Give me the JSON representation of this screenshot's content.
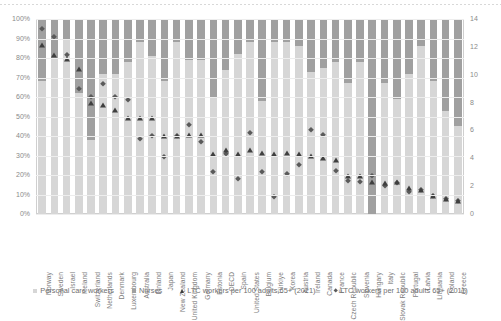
{
  "chart_data": {
    "type": "bar",
    "subtype": "stacked-bar-with-markers",
    "title": "",
    "xlabel": "",
    "ylabel": "",
    "ylim": [
      0,
      100
    ],
    "y2lim": [
      0,
      14
    ],
    "y_ticks": [
      "0%",
      "10%",
      "20%",
      "30%",
      "40%",
      "50%",
      "60%",
      "70%",
      "80%",
      "90%",
      "100%"
    ],
    "y2_ticks": [
      "0",
      "2",
      "4",
      "6",
      "8",
      "10",
      "12",
      "14"
    ],
    "grid": true,
    "legend_position": "bottom",
    "categories": [
      "Norway",
      "Sweden",
      "Israel",
      "Iceland",
      "Switzerland",
      "Netherlands",
      "Denmark",
      "Luxembourg",
      "Australia",
      "Finland",
      "Japan",
      "New Zealand",
      "United Kingdom",
      "Germany",
      "Estonia",
      "OECD",
      "Spain",
      "United States",
      "Belgium",
      "Türkiye",
      "Korea",
      "Austria",
      "Ireland",
      "Canada",
      "France",
      "Czech Republic",
      "Slovenia",
      "Hungary",
      "Italy",
      "Slovak Republic",
      "Portugal",
      "Latvia",
      "Lithuania",
      "Poland",
      "Greece"
    ],
    "series": [
      {
        "name": "Personal care workers",
        "axis": "left",
        "unit": "%",
        "color": "#d6d6d6",
        "values": [
          68,
          80,
          90,
          62,
          38,
          72,
          72,
          78,
          88,
          81,
          68,
          88,
          79,
          79,
          60,
          74,
          82,
          88,
          58,
          88,
          88,
          86,
          73,
          75,
          78,
          67,
          78,
          0,
          67,
          59,
          72,
          86,
          68,
          53,
          45
        ]
      },
      {
        "name": "Nurses",
        "axis": "left",
        "unit": "%",
        "color": "#a0a0a0",
        "values": [
          32,
          20,
          10,
          38,
          62,
          28,
          28,
          22,
          12,
          19,
          32,
          12,
          21,
          21,
          40,
          26,
          18,
          12,
          42,
          12,
          12,
          14,
          27,
          25,
          22,
          33,
          22,
          100,
          33,
          41,
          28,
          14,
          32,
          47,
          55
        ]
      },
      {
        "name": "LTC workers per 100 adults 65+ (2021)",
        "axis": "right",
        "marker": "triangle",
        "color": "#3f3f3f",
        "values": [
          12.1,
          11.4,
          11.1,
          10.4,
          8.0,
          7.8,
          7.5,
          6.9,
          6.9,
          6.9,
          5.6,
          5.6,
          5.7,
          5.7,
          4.3,
          4.6,
          4.3,
          4.6,
          4.4,
          4.3,
          4.4,
          4.3,
          4.2,
          4.0,
          3.9,
          2.7,
          2.7,
          2.3,
          2.2,
          2.3,
          1.9,
          1.7,
          1.3,
          1.1,
          0.9
        ]
      },
      {
        "name": "LTC workers per 100 adults 65+ (2011)",
        "axis": "right",
        "marker": "diamond",
        "color": "#5a5a5a",
        "values": [
          13.3,
          12.7,
          11.4,
          9.0,
          8.4,
          9.3,
          8.4,
          8.2,
          5.4,
          5.6,
          4.1,
          5.6,
          6.4,
          5.2,
          3.0,
          4.3,
          2.5,
          5.8,
          3.0,
          1.2,
          2.9,
          3.5,
          6.0,
          5.7,
          3.1,
          2.4,
          2.3,
          2.7,
          2.0,
          2.2,
          1.6,
          1.7,
          1.3,
          1.1,
          0.9
        ]
      }
    ]
  },
  "legend": {
    "items": [
      {
        "label": "Personal care workers",
        "marker": "square-light"
      },
      {
        "label": "Nurses",
        "marker": "square-dark"
      },
      {
        "label": "LTC workers per 100 adults 65+ (2021)",
        "marker": "triangle"
      },
      {
        "label": "LTC workers per 100 adults 65+ (2011)",
        "marker": "diamond"
      }
    ]
  },
  "colors": {
    "personal_care_workers": "#d6d6d6",
    "nurses": "#a0a0a0",
    "marker_2021": "#3f3f3f",
    "marker_2011": "#5a5a5a",
    "grid": "#ededed",
    "axis_text": "#8a8a8a"
  }
}
